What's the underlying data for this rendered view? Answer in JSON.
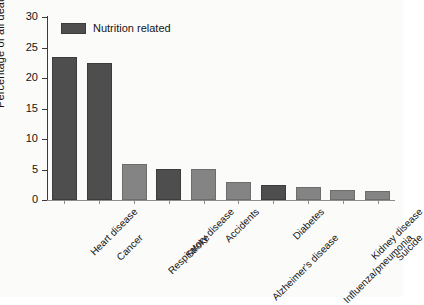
{
  "chart_data": {
    "type": "bar",
    "title": "",
    "xlabel": "",
    "ylabel": "Percentage of all deaths",
    "ylim": [
      0,
      30
    ],
    "yticks": [
      0,
      5,
      10,
      15,
      20,
      25,
      30
    ],
    "grid": false,
    "legend": {
      "position": "top-left",
      "entries": [
        {
          "label": "Nutrition related",
          "color": "#4e4e4e"
        }
      ]
    },
    "categories": [
      "Heart disease",
      "Cancer",
      "Respiratory disease",
      "Stroke",
      "Accidents",
      "Alzheimer's disease",
      "Diabetes",
      "Influenza/pneumonia",
      "Kidney disease",
      "Suicide"
    ],
    "values": [
      23.4,
      22.5,
      5.9,
      5.1,
      5.1,
      2.9,
      2.5,
      2.1,
      1.7,
      1.5
    ],
    "bar_groups": [
      "nutrition-related",
      "nutrition-related",
      "other",
      "nutrition-related",
      "other",
      "other",
      "nutrition-related",
      "other",
      "other",
      "other"
    ],
    "colors": {
      "nutrition_related": "#4e4e4e",
      "other": "#848484",
      "axis": "#3a3a3a",
      "background": "#fbfbfa"
    }
  }
}
